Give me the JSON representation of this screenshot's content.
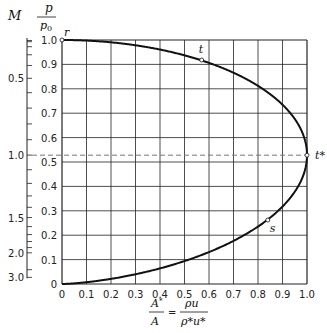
{
  "chart_data": {
    "type": "line",
    "title": "",
    "xlabel_num": "A*",
    "xlabel_den": "A",
    "xlabel_eq_num": "ρu",
    "xlabel_eq_den": "ρ*u*",
    "ylabel_num": "p",
    "ylabel_den": "p0",
    "m_axis_label": "M",
    "xlim": [
      0,
      1.0
    ],
    "ylim": [
      0,
      1.0
    ],
    "grid": true,
    "x_ticks": [
      "0",
      "0.1",
      "0.2",
      "0.3",
      "0.4",
      "0.5",
      "0.6",
      "0.7",
      "0.8",
      "0.9",
      "1.0"
    ],
    "y_ticks": [
      "0",
      "0.1",
      "0.2",
      "0.3",
      "0.4",
      "0.5",
      "0.6",
      "0.7",
      "0.8",
      "0.9",
      "1.0"
    ],
    "m_scale": {
      "labels": [
        {
          "M": 0.5,
          "label": "0.5"
        },
        {
          "M": 1.0,
          "label": "1.0"
        },
        {
          "M": 1.5,
          "label": "1.5"
        },
        {
          "M": 2.0,
          "label": "2.0"
        },
        {
          "M": 3.0,
          "label": "3.0"
        }
      ],
      "minor_ticks": [
        0.1,
        0.2,
        0.3,
        0.4,
        0.5,
        0.6,
        0.7,
        0.8,
        0.9,
        1.0,
        1.1,
        1.2,
        1.3,
        1.4,
        1.5,
        1.6,
        1.7,
        1.8,
        1.9,
        2.0,
        2.5,
        3.0
      ]
    },
    "gamma": 1.4,
    "series": [
      {
        "name": "isentropic flow curve",
        "x": [
          0,
          0.172,
          0.337,
          0.491,
          0.629,
          0.746,
          0.842,
          0.963,
          1.0,
          0.97,
          0.85,
          0.593,
          0.379,
          0.236,
          0.093,
          0
        ],
        "y": [
          1.0,
          0.993,
          0.9725,
          0.9395,
          0.8956,
          0.843,
          0.784,
          0.656,
          0.5283,
          0.4124,
          0.2724,
          0.1278,
          0.0585,
          0.0272,
          0.0066,
          0
        ]
      }
    ],
    "reference_line": {
      "y": 0.528,
      "style": "dashed"
    },
    "annotations": [
      {
        "label": "r",
        "x": 0.0,
        "y": 1.0
      },
      {
        "label": "t",
        "x": 0.57,
        "y": 0.918
      },
      {
        "label": "t*",
        "x": 1.0,
        "y": 0.528
      },
      {
        "label": "s",
        "x": 0.84,
        "y": 0.262
      }
    ]
  }
}
